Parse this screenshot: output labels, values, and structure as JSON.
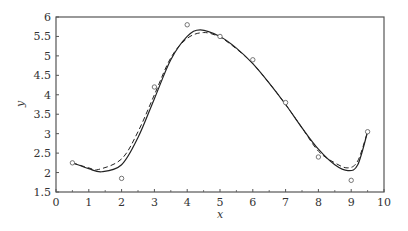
{
  "chart_data": {
    "type": "scatter",
    "title": "",
    "xlabel": "x",
    "ylabel": "y",
    "xlim": [
      0,
      10
    ],
    "ylim": [
      1.5,
      6
    ],
    "x_ticks": [
      0,
      1,
      2,
      3,
      4,
      5,
      6,
      7,
      8,
      9,
      10
    ],
    "y_ticks": [
      1.5,
      2,
      2.5,
      3,
      3.5,
      4,
      4.5,
      5,
      5.5,
      6
    ],
    "x_tick_labels": [
      "0",
      "1",
      "2",
      "3",
      "4",
      "5",
      "6",
      "7",
      "8",
      "9",
      "10"
    ],
    "y_tick_labels": [
      "1.5",
      "2",
      "2.5",
      "3",
      "3.5",
      "4",
      "4.5",
      "5",
      "5.5",
      "6"
    ],
    "grid": false,
    "legend": null,
    "series": [
      {
        "name": "data points",
        "style": "open-circle-markers",
        "x": [
          0.5,
          2,
          3,
          4,
          5,
          6,
          7,
          8,
          9,
          9.5
        ],
        "y": [
          2.25,
          1.85,
          4.2,
          5.8,
          5.5,
          4.9,
          3.8,
          2.4,
          1.8,
          3.05
        ]
      },
      {
        "name": "fit (solid)",
        "style": "solid-line",
        "x": [
          0.5,
          1,
          1.4,
          2,
          2.5,
          3,
          3.5,
          4,
          4.4,
          5,
          5.5,
          6,
          6.5,
          7,
          7.5,
          8,
          8.5,
          8.9,
          9.2,
          9.5
        ],
        "y": [
          2.25,
          2.1,
          2.02,
          2.2,
          2.9,
          3.9,
          4.9,
          5.5,
          5.67,
          5.5,
          5.2,
          4.8,
          4.3,
          3.75,
          3.15,
          2.6,
          2.2,
          2.05,
          2.2,
          3.05
        ]
      },
      {
        "name": "fit (dashed)",
        "style": "dashed-line",
        "x": [
          0.5,
          1,
          1.3,
          2,
          2.5,
          3,
          3.5,
          4,
          4.5,
          5,
          5.5,
          6,
          6.5,
          7,
          7.5,
          8,
          8.5,
          8.9,
          9.2,
          9.5
        ],
        "y": [
          2.25,
          2.12,
          2.08,
          2.35,
          3.05,
          4.0,
          4.95,
          5.45,
          5.6,
          5.48,
          5.18,
          4.8,
          4.3,
          3.75,
          3.15,
          2.55,
          2.25,
          2.12,
          2.3,
          3.05
        ]
      }
    ]
  },
  "colors": {
    "axis": "#555555",
    "line": "#222222",
    "marker": "#666666",
    "background": "#ffffff"
  }
}
